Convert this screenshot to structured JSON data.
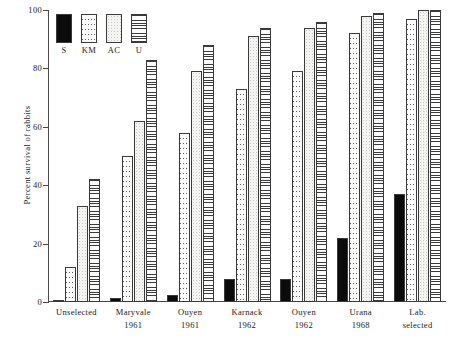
{
  "chart_data": {
    "type": "bar",
    "title": "",
    "subtitle": "",
    "xlabel": "",
    "ylabel": "Percent survival of rabbits",
    "ylim": [
      0,
      100
    ],
    "yticks": [
      0,
      20,
      40,
      60,
      80,
      100
    ],
    "grid": false,
    "legend_position": "top-left",
    "categories": [
      "Unselected",
      "Maryvale 1961",
      "Ouyen 1961",
      "Karnack 1962",
      "Ouyen 1962",
      "Urana 1968",
      "Lab. selected"
    ],
    "category_lines": [
      {
        "line1": "Unselected",
        "line2": ""
      },
      {
        "line1": "Maryvale",
        "line2": "1961"
      },
      {
        "line1": "Ouyen",
        "line2": "1961"
      },
      {
        "line1": "Karnack",
        "line2": "1962"
      },
      {
        "line1": "Ouyen",
        "line2": "1962"
      },
      {
        "line1": "Urana",
        "line2": "1968"
      },
      {
        "line1": "Lab.",
        "line2": "selected"
      }
    ],
    "series": [
      {
        "name": "S",
        "pattern": "solid-black",
        "values": [
          0.5,
          1.5,
          2.5,
          8,
          8,
          22,
          37
        ]
      },
      {
        "name": "KM",
        "pattern": "coarse-speckle",
        "values": [
          12,
          50,
          58,
          73,
          79,
          92,
          97
        ]
      },
      {
        "name": "AC",
        "pattern": "fine-stipple",
        "values": [
          33,
          62,
          79,
          91,
          94,
          98,
          100
        ]
      },
      {
        "name": "U",
        "pattern": "horizontal-lines",
        "values": [
          42,
          83,
          88,
          94,
          96,
          99,
          100
        ]
      }
    ]
  },
  "legend": {
    "entries": [
      {
        "label": "S",
        "pattern": "solid-black"
      },
      {
        "label": "KM",
        "pattern": "coarse-speckle"
      },
      {
        "label": "AC",
        "pattern": "fine-stipple"
      },
      {
        "label": "U",
        "pattern": "horizontal-lines"
      }
    ]
  },
  "colors": {
    "axis": "#4a4a4a",
    "bar_outline": "#3a3a3a",
    "solid_fill": "#0b0b0b",
    "background": "#ffffff",
    "text": "#1a1a1a"
  }
}
